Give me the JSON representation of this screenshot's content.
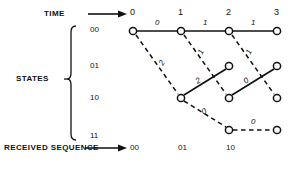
{
  "diagram": {
    "title_axis_time": "TIME",
    "title_axis_states": "STATES",
    "title_received": "RECEIVED SEQUENCE",
    "time_ticks": [
      "0",
      "1",
      "2",
      "3"
    ],
    "state_ticks": [
      "00",
      "01",
      "10",
      "11"
    ],
    "received_sequence": [
      "00",
      "01",
      "10"
    ],
    "branch_metrics": {
      "top_0_1": "0",
      "top_1_2": "1",
      "top_2_3": "1",
      "diag_00_to_10_t0": "2",
      "diag_01_down_t1": "1",
      "diag_10_up_t1": "2",
      "diag_10_down_t1": "0",
      "diag_00_down_t2": "1",
      "diag_11_right_t2": "0",
      "solid_10_up_t2": "0"
    },
    "colors": {
      "ink": "#111111",
      "background": "#ffffff"
    },
    "nodes": [
      {
        "id": "n00_t0",
        "x": 133,
        "y": 31,
        "state": "00",
        "time": "0"
      },
      {
        "id": "n00_t1",
        "x": 181,
        "y": 31,
        "state": "00",
        "time": "1"
      },
      {
        "id": "n00_t2",
        "x": 229,
        "y": 31,
        "state": "00",
        "time": "2"
      },
      {
        "id": "n00_t3",
        "x": 277,
        "y": 31,
        "state": "00",
        "time": "3"
      },
      {
        "id": "n01_t2",
        "x": 229,
        "y": 66,
        "state": "01",
        "time": "2"
      },
      {
        "id": "n01_t3",
        "x": 277,
        "y": 66,
        "state": "01",
        "time": "3"
      },
      {
        "id": "n10_t1",
        "x": 181,
        "y": 98,
        "state": "10",
        "time": "1"
      },
      {
        "id": "n10_t2",
        "x": 229,
        "y": 98,
        "state": "10",
        "time": "2"
      },
      {
        "id": "n10_t3",
        "x": 277,
        "y": 98,
        "state": "10",
        "time": "3"
      },
      {
        "id": "n11_t2",
        "x": 229,
        "y": 130,
        "state": "11",
        "time": "2"
      },
      {
        "id": "n11_t3",
        "x": 277,
        "y": 130,
        "state": "11",
        "time": "3"
      }
    ]
  }
}
